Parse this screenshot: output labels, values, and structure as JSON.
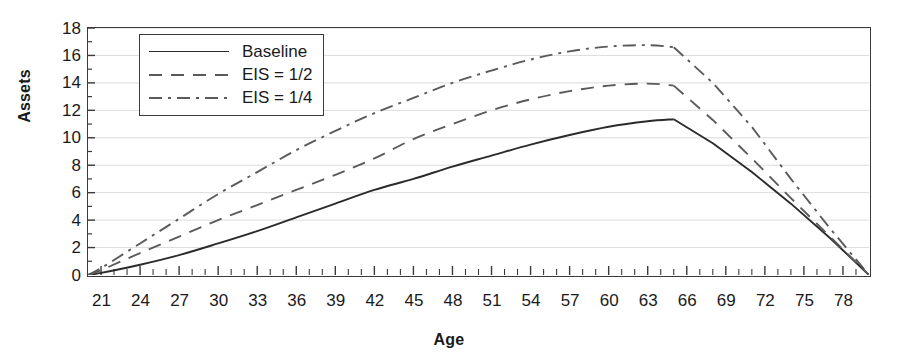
{
  "chart_data": {
    "type": "line",
    "title": "",
    "xlabel": "Age",
    "ylabel": "Assets",
    "xlim": [
      20,
      80
    ],
    "ylim": [
      0,
      18
    ],
    "xticks": [
      21,
      24,
      27,
      30,
      33,
      36,
      39,
      42,
      45,
      48,
      51,
      54,
      57,
      60,
      63,
      66,
      69,
      72,
      75,
      78
    ],
    "yticks": [
      0,
      2,
      4,
      6,
      8,
      10,
      12,
      14,
      16,
      18
    ],
    "grid": "horizontal",
    "legend_position": "upper-left-inside",
    "x": [
      20,
      21,
      24,
      27,
      30,
      33,
      36,
      39,
      42,
      45,
      48,
      51,
      54,
      57,
      60,
      63,
      65,
      68,
      71,
      74,
      77,
      80
    ],
    "series": [
      {
        "name": "Baseline",
        "style": "solid",
        "color": "#2b2b2b",
        "values": [
          0,
          0.15,
          0.75,
          1.45,
          2.3,
          3.2,
          4.2,
          5.2,
          6.2,
          7.0,
          7.9,
          8.7,
          9.5,
          10.2,
          10.8,
          11.2,
          11.35,
          9.6,
          7.5,
          5.2,
          2.7,
          0
        ]
      },
      {
        "name": "EIS = 1/2",
        "style": "dashed",
        "color": "#5a5a5a",
        "values": [
          0,
          0.35,
          1.6,
          2.8,
          4.0,
          5.1,
          6.2,
          7.3,
          8.5,
          9.9,
          11.0,
          12.0,
          12.8,
          13.4,
          13.8,
          13.95,
          13.8,
          11.3,
          8.5,
          5.6,
          2.8,
          0
        ]
      },
      {
        "name": "EIS = 1/4",
        "style": "dash-dot",
        "color": "#5a5a5a",
        "values": [
          0,
          0.5,
          2.3,
          4.1,
          5.9,
          7.5,
          9.1,
          10.5,
          11.8,
          12.9,
          14.0,
          14.9,
          15.7,
          16.3,
          16.65,
          16.75,
          16.6,
          14.0,
          10.8,
          7.0,
          3.4,
          0
        ]
      }
    ]
  },
  "legend": {
    "items": [
      {
        "label": "Baseline"
      },
      {
        "label": "EIS = 1/2"
      },
      {
        "label": "EIS = 1/4"
      }
    ]
  }
}
